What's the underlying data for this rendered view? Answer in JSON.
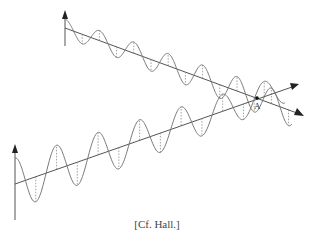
{
  "figure": {
    "point_label": "A",
    "caption": "[Cf. Hall.]",
    "waves": [
      {
        "name": "upper-wave",
        "cycles": 6.5,
        "amplitude_trend": "increasing"
      },
      {
        "name": "lower-wave",
        "cycles": 6.5,
        "amplitude_trend": "decreasing"
      }
    ],
    "colors": {
      "line": "#555555",
      "wave": "#777777",
      "text": "#333333"
    }
  }
}
